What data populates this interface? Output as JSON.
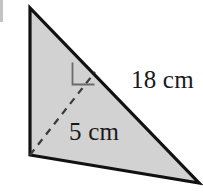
{
  "figure": {
    "kind": "geometry-diagram",
    "shape": "triangle",
    "background_color": "#ffffff",
    "fill_color": "#d2d2d2",
    "outline_color": "#111111",
    "outline_width": 3,
    "dash_color": "#3a3a3a",
    "dash_width": 2,
    "right_angle_color": "#6b6b6b",
    "text_color": "#1a1a1a",
    "triangle_vertices": [
      {
        "name": "apex",
        "x": 30,
        "y": 8
      },
      {
        "name": "bottom-left",
        "x": 30,
        "y": 155
      },
      {
        "name": "bottom-right",
        "x": 199,
        "y": 183
      }
    ],
    "altitude": {
      "from_x": 30,
      "from_y": 155,
      "to_x": 95,
      "to_y": 72,
      "style": "dashed"
    },
    "right_angle_marker": {
      "x": 72,
      "y": 62,
      "size": 22,
      "at_vertex": "altitude-foot"
    }
  },
  "labels": {
    "hypotenuse": "18 cm",
    "height": "5 cm"
  },
  "measurements": [
    {
      "id": "hypotenuse",
      "value": 18,
      "unit": "cm",
      "text": "18 cm"
    },
    {
      "id": "height",
      "value": 5,
      "unit": "cm",
      "text": "5 cm"
    }
  ]
}
